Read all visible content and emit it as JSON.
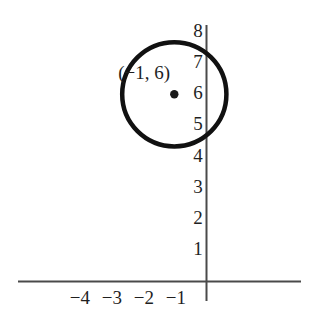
{
  "figure": {
    "width": 323,
    "height": 326,
    "background_color": "#ffffff",
    "ink_color": "#1a1a1a",
    "axis_color": "#4a4a4a"
  },
  "chart_data": {
    "type": "scatter",
    "title": "",
    "xlabel": "",
    "ylabel": "",
    "grid": false,
    "legend": null,
    "xlim": [
      -5.8,
      3.0
    ],
    "ylim": [
      -0.6,
      8.6
    ],
    "x_ticks": [
      -4,
      -3,
      -2,
      -1
    ],
    "x_tick_labels": [
      "−4",
      "−3",
      "−2",
      "−1"
    ],
    "y_ticks": [
      1,
      2,
      3,
      4,
      5,
      6,
      7,
      8
    ],
    "y_tick_labels": [
      "1",
      "2",
      "3",
      "4",
      "5",
      "6",
      "7",
      "8"
    ],
    "points": [
      {
        "name": "circle-center",
        "x": -1,
        "y": 6,
        "label": "(−1, 6)",
        "marker": "filled-dot"
      }
    ],
    "shapes": [
      {
        "name": "circle",
        "type": "circle",
        "center_x": -1,
        "center_y": 6,
        "radius": 1.67,
        "stroke": "#111111",
        "stroke_width": 4.5,
        "fill": "none"
      }
    ]
  },
  "axes": {
    "x_axis_label": "",
    "y_axis_label": "",
    "origin_label": ""
  }
}
